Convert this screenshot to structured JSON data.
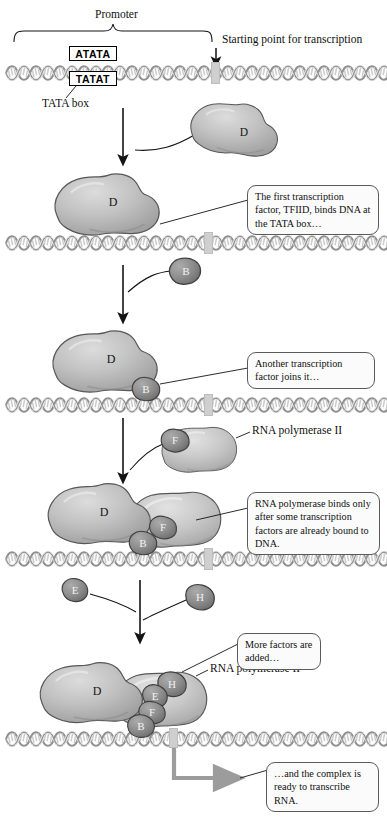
{
  "figure": {
    "type": "biology-process-diagram"
  },
  "labels": {
    "promoter": "Promoter",
    "start_point": "Starting point for transcription",
    "tata_box": "TATA box",
    "tata_top_strand": "ATATA",
    "tata_bottom_strand": "TATAT",
    "rna_pol_mid": "RNA polymerase II",
    "rna_pol_bottom": "RNA polymerase II"
  },
  "callouts": [
    {
      "id": "c1",
      "text": "The first transcription factor, TFIID, binds DNA at the TATA box…"
    },
    {
      "id": "c2",
      "text": "Another transcription factor joins it…"
    },
    {
      "id": "c3",
      "text": "RNA polymerase binds only after some transcription factors are already bound to DNA."
    },
    {
      "id": "c4",
      "text": "More factors are added…"
    },
    {
      "id": "c5",
      "text": "…and the complex is ready to transcribe RNA."
    }
  ],
  "proteins": {
    "tfiid": "D",
    "tfiib": "B",
    "tfiif": "F",
    "tfiie": "E",
    "tfiih": "H"
  },
  "stages": [
    {
      "n": 1,
      "name": "bare-dna-with-tata-box",
      "bound": []
    },
    {
      "n": 2,
      "name": "tfiid-approaching",
      "bound": [],
      "free": [
        "D"
      ]
    },
    {
      "n": 3,
      "name": "tfiid-bound",
      "bound": [
        "D"
      ]
    },
    {
      "n": 4,
      "name": "tfiib-approaching",
      "bound": [
        "D"
      ],
      "free": [
        "B"
      ]
    },
    {
      "n": 5,
      "name": "tfiid-tfiib-bound",
      "bound": [
        "D",
        "B"
      ]
    },
    {
      "n": 6,
      "name": "polymerase-with-f-approaching",
      "bound": [
        "D",
        "B"
      ],
      "free": [
        "F"
      ]
    },
    {
      "n": 7,
      "name": "polymerase-bound",
      "bound": [
        "D",
        "B",
        "F"
      ]
    },
    {
      "n": 8,
      "name": "e-and-h-approaching",
      "bound": [
        "D",
        "B",
        "F"
      ],
      "free": [
        "E",
        "H"
      ]
    },
    {
      "n": 9,
      "name": "complete-initiation-complex",
      "bound": [
        "D",
        "B",
        "F",
        "E",
        "H"
      ]
    }
  ],
  "colors": {
    "protein_large": "#b9b9b9",
    "protein_small": "#8a8a8a",
    "dna": "#9a9a9a",
    "arrow": "#1a1a1a",
    "gray_arrow": "#9c9c9c",
    "callout_border": "#5a5a5a",
    "start_marker": "#cfcfcf"
  }
}
